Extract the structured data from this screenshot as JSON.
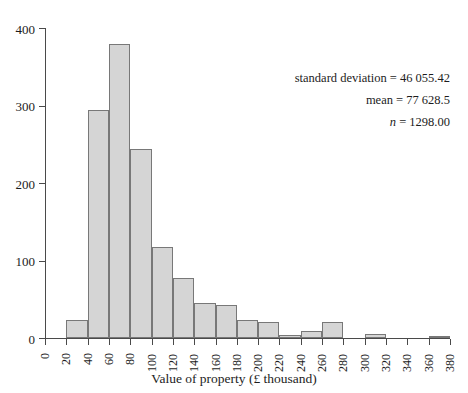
{
  "chart_data": {
    "type": "bar",
    "subtype": "histogram",
    "title": "",
    "xlabel": "Value of property (£ thousand)",
    "ylabel": "",
    "xlim": [
      0,
      380
    ],
    "ylim": [
      0,
      400
    ],
    "bin_width": 20,
    "grid": false,
    "legend": null,
    "x_tick_labels": [
      "0",
      "20",
      "40",
      "60",
      "80",
      "100",
      "120",
      "140",
      "160",
      "180",
      "200",
      "220",
      "240",
      "260",
      "280",
      "300",
      "320",
      "340",
      "360",
      "380"
    ],
    "x_tick_values": [
      0,
      20,
      40,
      60,
      80,
      100,
      120,
      140,
      160,
      180,
      200,
      220,
      240,
      260,
      280,
      300,
      320,
      340,
      360,
      380
    ],
    "y_tick_labels": [
      "0",
      "100",
      "200",
      "300",
      "400"
    ],
    "y_tick_values": [
      0,
      100,
      200,
      300,
      400
    ],
    "bins": [
      {
        "range": "0-20",
        "start": 0,
        "end": 20,
        "count": 0
      },
      {
        "range": "20-40",
        "start": 20,
        "end": 40,
        "count": 23
      },
      {
        "range": "40-60",
        "start": 40,
        "end": 60,
        "count": 294
      },
      {
        "range": "60-80",
        "start": 60,
        "end": 80,
        "count": 379
      },
      {
        "range": "80-100",
        "start": 80,
        "end": 100,
        "count": 244
      },
      {
        "range": "100-120",
        "start": 100,
        "end": 120,
        "count": 117
      },
      {
        "range": "120-140",
        "start": 120,
        "end": 140,
        "count": 77
      },
      {
        "range": "140-160",
        "start": 140,
        "end": 160,
        "count": 45
      },
      {
        "range": "160-180",
        "start": 160,
        "end": 180,
        "count": 43
      },
      {
        "range": "180-200",
        "start": 180,
        "end": 200,
        "count": 23
      },
      {
        "range": "200-220",
        "start": 200,
        "end": 220,
        "count": 21
      },
      {
        "range": "220-240",
        "start": 220,
        "end": 240,
        "count": 4
      },
      {
        "range": "240-260",
        "start": 240,
        "end": 260,
        "count": 9
      },
      {
        "range": "260-280",
        "start": 260,
        "end": 280,
        "count": 21
      },
      {
        "range": "280-300",
        "start": 280,
        "end": 300,
        "count": 0
      },
      {
        "range": "300-320",
        "start": 300,
        "end": 320,
        "count": 5
      },
      {
        "range": "320-340",
        "start": 320,
        "end": 340,
        "count": 0
      },
      {
        "range": "340-360",
        "start": 340,
        "end": 360,
        "count": 0
      },
      {
        "range": "360-380",
        "start": 360,
        "end": 380,
        "count": 3
      }
    ],
    "categories": [
      "0-20",
      "20-40",
      "40-60",
      "60-80",
      "80-100",
      "100-120",
      "120-140",
      "140-160",
      "160-180",
      "180-200",
      "200-220",
      "220-240",
      "240-260",
      "260-280",
      "280-300",
      "300-320",
      "320-340",
      "340-360",
      "360-380"
    ],
    "values": [
      0,
      23,
      294,
      379,
      244,
      117,
      77,
      45,
      43,
      23,
      21,
      4,
      9,
      21,
      0,
      5,
      0,
      0,
      3
    ],
    "annotations": [
      {
        "label": "standard deviation",
        "value": "46 055.42",
        "text": "standard deviation = 46 055.42"
      },
      {
        "label": "mean",
        "value": "77 628.5",
        "text": "mean = 77 628.5"
      },
      {
        "label": "n",
        "value": "1298.00",
        "text": "n = 1298.00",
        "italic_label": true
      }
    ],
    "colors": {
      "bar_fill": "#d5d5d5",
      "bar_border": "#787878",
      "axis": "#4a4a4a",
      "text": "#1c1c1c",
      "background": "#ffffff"
    }
  }
}
